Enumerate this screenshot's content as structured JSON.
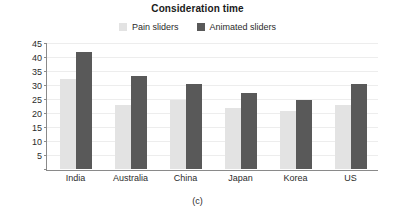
{
  "chart_data": {
    "type": "bar",
    "title": "Consideration time",
    "caption": "(c)",
    "xlabel": "",
    "ylabel": "",
    "ylim": [
      0,
      45
    ],
    "yticks": [
      0,
      5,
      10,
      15,
      20,
      25,
      30,
      35,
      40,
      45
    ],
    "ytick_labels": [
      "",
      "5",
      "10",
      "15",
      "20",
      "25",
      "30",
      "35",
      "40",
      "45"
    ],
    "grid": true,
    "legend_position": "top-center",
    "categories": [
      "India",
      "Australia",
      "China",
      "Japan",
      "Korea",
      "US"
    ],
    "series": [
      {
        "name": "Pain sliders",
        "color": "#e3e3e3",
        "values": [
          32.5,
          23.0,
          25.0,
          22.0,
          21.0,
          23.0
        ]
      },
      {
        "name": "Animated sliders",
        "color": "#595959",
        "values": [
          42.0,
          33.5,
          30.5,
          27.5,
          25.0,
          30.5
        ]
      }
    ]
  }
}
